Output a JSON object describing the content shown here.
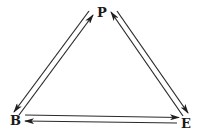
{
  "diagram": {
    "type": "triangle-cycle",
    "nodes": [
      {
        "id": "P",
        "label": "P",
        "x": 102,
        "y": 13
      },
      {
        "id": "B",
        "label": "B",
        "x": 16,
        "y": 121
      },
      {
        "id": "E",
        "label": "E",
        "x": 186,
        "y": 124
      }
    ],
    "edges": [
      {
        "from": "P",
        "to": "B",
        "direction": "P→B"
      },
      {
        "from": "B",
        "to": "P",
        "direction": "B→P"
      },
      {
        "from": "E",
        "to": "P",
        "direction": "E→P"
      },
      {
        "from": "P",
        "to": "E",
        "direction": "P→E"
      },
      {
        "from": "B",
        "to": "E",
        "direction": "B→E"
      },
      {
        "from": "E",
        "to": "B",
        "direction": "E→B"
      }
    ],
    "colors": {
      "line": "#2a2a2a",
      "text": "#1a1a1a",
      "background": "#ffffff"
    }
  }
}
